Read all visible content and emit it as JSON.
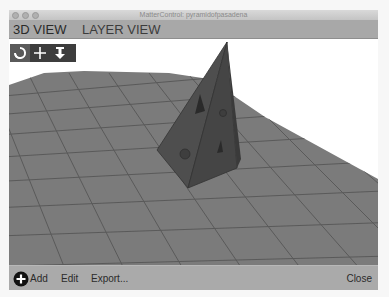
{
  "window": {
    "title": "MatterControl: pyramidofpasadena"
  },
  "tabs": [
    {
      "label": "3D VIEW",
      "active": true
    },
    {
      "label": "LAYER VIEW",
      "active": false
    }
  ],
  "view_tools": [
    {
      "name": "rotate",
      "icon": "rotate-icon",
      "active": true
    },
    {
      "name": "move",
      "icon": "move-icon",
      "active": false
    },
    {
      "name": "zoom",
      "icon": "zoom-down-arrow-icon",
      "active": false
    }
  ],
  "viewport": {
    "object": "pyramid",
    "background_color": "#ffffff",
    "bed_color": "#7a7a7a",
    "object_color": "#4a4a4a"
  },
  "bottom_bar": {
    "add_label": "Add",
    "edit_label": "Edit",
    "export_label": "Export...",
    "close_label": "Close"
  }
}
